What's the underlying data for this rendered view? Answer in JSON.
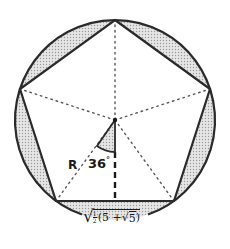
{
  "figure": {
    "type": "regular-pentagon-inscribed-in-circle",
    "colors": {
      "stroke": "#2a2a2a",
      "segment_fill": "#d4d4d4",
      "background": "#ffffff",
      "dotted": "#555555"
    },
    "circle": {
      "cx": 115,
      "cy": 120,
      "r": 100
    },
    "center": {
      "x": 115,
      "y": 120
    },
    "vertices": [
      {
        "x": 115,
        "y": 20
      },
      {
        "x": 210,
        "y": 89
      },
      {
        "x": 174,
        "y": 201
      },
      {
        "x": 56,
        "y": 201
      },
      {
        "x": 20,
        "y": 89
      }
    ],
    "labels": {
      "radius": "R",
      "angle": "36",
      "angle_unit": "°",
      "side_length": {
        "sqrt": "√",
        "frac_num": "1",
        "frac_den": "2",
        "open": "(5 + ",
        "inner_sqrt": "√",
        "inner_val": "5",
        "close": ")"
      }
    }
  }
}
